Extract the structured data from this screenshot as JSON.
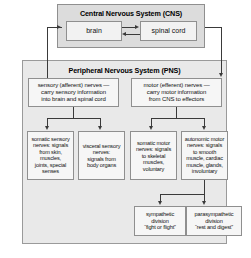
{
  "diagram": {
    "cns": {
      "label": "Central Nervous System (CNS)",
      "brain": "brain",
      "spinal_cord": "spinal cord"
    },
    "pns": {
      "label": "Peripheral Nervous System (PNS)",
      "sensory": "sensory (afferent) nerves —\ncarry sensory information\ninto brain and spinal cord",
      "motor": "motor (efferent) nerves —\ncarry motor information\nfrom CNS to effectors",
      "somatic_sensory": "somatic sensory\nnerves: signals\nfrom skin,\nmuscles,\njoints, special\nsenses",
      "visceral_sensory": "visceral sensory\nnerves:\nsignals from\nbody organs",
      "somatic_motor": "somatic motor\nnerves: signals\nto skeletal\nmuscles,\nvoluntary",
      "autonomic_motor": "autonomic motor\nnerves: signals\nto smooth\nmuscle, cardiac\nmuscle, glands,\ninvoluntary",
      "sympathetic": "sympathetic\ndivision\n“fight or flight”",
      "parasympathetic": "parasympathetic\ndivision\n“rest and digest”"
    },
    "colors": {
      "cns_fill": "#dcdcdc",
      "pns_fill": "#e9e9e9",
      "leaf_fill": "#f6f6f6",
      "border": "#8f8f8f",
      "connector": "#3a3a3a",
      "page": "#ffffff"
    }
  }
}
